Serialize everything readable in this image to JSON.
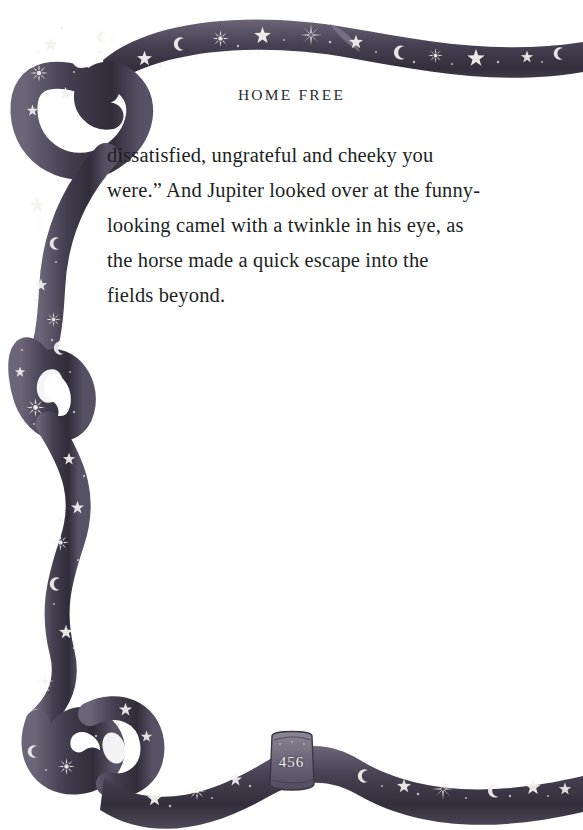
{
  "page": {
    "background_color": "#ffffff",
    "width": 583,
    "height": 830
  },
  "running_head": {
    "text": "HOME FREE"
  },
  "body": {
    "lines": [
      "dissatisfied, ungrateful and cheeky you",
      "were.” And Jupiter looked over at the funny-",
      "looking camel with a twinkle in his eye, as",
      "the horse made a quick escape into the",
      "fields beyond."
    ],
    "full_text": "dissatisfied, ungrateful and cheeky you were.” And Jupiter looked over at the funny-looking camel with a twinkle in his eye, as the horse made a quick escape into the fields beyond."
  },
  "page_number": {
    "text": "456"
  },
  "border": {
    "description": "celestial-ribbon-border",
    "ribbon_color_dark": "#3a3642",
    "ribbon_color_mid": "#55505f",
    "ribbon_color_light": "#7d7789",
    "motif_color": "#f4f2ef",
    "motifs": [
      "star",
      "crescent-moon",
      "sunburst",
      "sparkle",
      "dot"
    ],
    "segments": [
      "top-left-curl",
      "top-band",
      "left-loop",
      "left-wave",
      "bottom-left-curl",
      "bottom-band",
      "page-number-cartouche"
    ]
  }
}
